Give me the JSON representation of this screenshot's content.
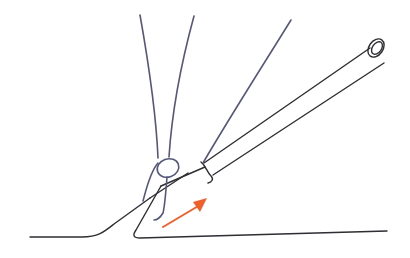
{
  "diagram": {
    "colors": {
      "outline": "#2e2e33",
      "thread": "#55587a",
      "arrow": "#f0602a",
      "background": "#ffffff"
    },
    "surface": {
      "left_path": "M30 237 L82 237 C98 237 104 232 114 224 L150 198",
      "right_path": "M161 186 L136 230 C132 236 134 238 140 238 L387 231"
    },
    "tube": {
      "upper_edge": "M150 198 L188 173 M204 163 L370 48",
      "lower_edge": "M161 186 L205 167 M213 175 L384 63",
      "lower_inner_tip": "M136 230 L205 183",
      "end_ellipse": {
        "cx": 376,
        "cy": 48,
        "rx": 7,
        "ry": 10,
        "rotate": 35
      },
      "end_inner_ellipse": {
        "cx": 377,
        "cy": 48,
        "rx": 4.5,
        "ry": 7,
        "rotate": 35
      },
      "collar_path": "M201 162 C206 166 207 172 211 176 C214 179 212 182 208 183"
    },
    "threads": {
      "left_strand": "M140 15 C148 60 156 110 158 158",
      "middle_strand": "M194 16 C182 60 172 110 169 157",
      "right_strand": "M291 20 C260 70 228 120 203 163",
      "loop_ellipse": {
        "cx": 168,
        "cy": 168,
        "rx": 11,
        "ry": 9,
        "rotate": -20
      },
      "wrap_front": "M158 163 C150 172 146 190 143 201",
      "wrap_back": "M167 177 C166 190 165 205 163 213 C160 218 157 220 154 220"
    },
    "arrow": {
      "shaft": {
        "x1": 163,
        "y1": 227,
        "x2": 200,
        "y2": 205
      },
      "head_points": "207,198 193,202 200,212"
    }
  }
}
